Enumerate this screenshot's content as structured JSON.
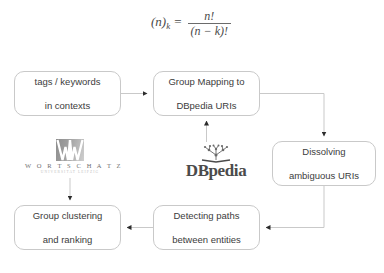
{
  "page": {
    "background_color": "#ffffff",
    "line_color": "#c9c9c9",
    "text_color": "#3c3c3c"
  },
  "formula": {
    "lhs_base": "(n)",
    "lhs_sub": "k",
    "equals": "=",
    "numerator": "n!",
    "denominator": "(n − k)!",
    "plain": "(n)_k = n! / (n - k)!"
  },
  "diagram": {
    "type": "flowchart",
    "nodes": [
      {
        "id": "tags",
        "label": "tags / keywords\nin contexts",
        "line1": "tags / keywords",
        "line2": "in contexts"
      },
      {
        "id": "mapping",
        "label": "Group Mapping to\nDBpedia URIs",
        "line1": "Group Mapping to",
        "line2": "DBpedia URIs"
      },
      {
        "id": "dissolve",
        "label": "Dissolving\nambiguous URIs",
        "line1": "Dissolving",
        "line2": "ambiguous URIs"
      },
      {
        "id": "detect",
        "label": "Detecting paths\nbetween entities",
        "line1": "Detecting paths",
        "line2": "between entities"
      },
      {
        "id": "cluster",
        "label": "Group clustering\nand ranking",
        "line1": "Group clustering",
        "line2": "and ranking"
      }
    ],
    "edges": [
      {
        "from": "tags",
        "to": "mapping"
      },
      {
        "from": "mapping",
        "to": "dissolve"
      },
      {
        "from": "dissolve",
        "to": "detect"
      },
      {
        "from": "detect",
        "to": "cluster"
      },
      {
        "from": "dbpedia-logo",
        "to": "mapping"
      },
      {
        "from": "wortschatz-logo",
        "to": "cluster"
      }
    ]
  },
  "logos": {
    "wortschatz": {
      "title": "W O R T S C H A T Z",
      "subtitle": "UNIVERSITAT LEIPZIG",
      "mark": "stylized-w-mark"
    },
    "dbpedia": {
      "wordmark": "DBpedia",
      "mark": "open-book-with-node-graph"
    }
  }
}
